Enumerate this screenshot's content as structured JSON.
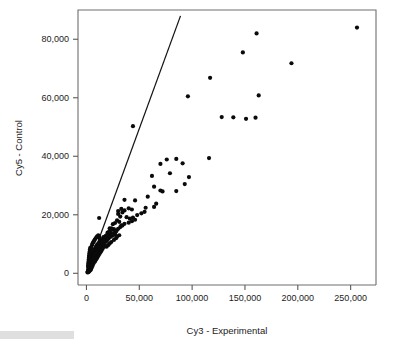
{
  "figure": {
    "background_color": "#ffffff",
    "point_color": "#0a0a0a",
    "line_color": "#141414",
    "frame_color": "#6e6e6e"
  },
  "chart_data": {
    "type": "scatter",
    "title": "",
    "xlabel": "Cy3 - Experimental",
    "ylabel": "Cy5 - Control",
    "xlim": [
      -8000,
      274000
    ],
    "ylim": [
      -4000,
      90000
    ],
    "xticks": [
      0,
      50000,
      100000,
      150000,
      200000,
      250000
    ],
    "xtick_labels": [
      "0",
      "50,000",
      "100,000",
      "150,000",
      "200,000",
      "250,000"
    ],
    "yticks": [
      0,
      20000,
      40000,
      60000,
      80000
    ],
    "ytick_labels": [
      "0",
      "20,000",
      "40,000",
      "60,000",
      "80,000"
    ],
    "grid": false,
    "legend": null,
    "annotations": [],
    "reference_line": {
      "name": "identity-trend-line",
      "x0": 0,
      "y0": 0,
      "x1": 89000,
      "y1": 88000,
      "slope": 0.9888,
      "intercept": 0
    },
    "series": [
      {
        "name": "spots",
        "marker": "filled-circle",
        "marker_size": 2.1,
        "points": [
          [
            256000,
            84000
          ],
          [
            161000,
            82000
          ],
          [
            148000,
            75500
          ],
          [
            194000,
            71800
          ],
          [
            117000,
            66800
          ],
          [
            96000,
            60500
          ],
          [
            163000,
            60800
          ],
          [
            128000,
            53400
          ],
          [
            139000,
            53300
          ],
          [
            151000,
            52800
          ],
          [
            160000,
            53200
          ],
          [
            44000,
            50300
          ],
          [
            116000,
            39400
          ],
          [
            85000,
            39100
          ],
          [
            76000,
            38900
          ],
          [
            70000,
            37400
          ],
          [
            91000,
            37600
          ],
          [
            79000,
            34200
          ],
          [
            62000,
            33300
          ],
          [
            97000,
            32900
          ],
          [
            93000,
            30500
          ],
          [
            64000,
            29600
          ],
          [
            70000,
            28300
          ],
          [
            72000,
            28000
          ],
          [
            85000,
            28100
          ],
          [
            58000,
            26200
          ],
          [
            36000,
            25100
          ],
          [
            46000,
            24900
          ],
          [
            66000,
            23800
          ],
          [
            64000,
            22700
          ],
          [
            56000,
            22400
          ],
          [
            40000,
            22200
          ],
          [
            43000,
            21800
          ],
          [
            36000,
            21500
          ],
          [
            33000,
            22000
          ],
          [
            34000,
            20800
          ],
          [
            30000,
            20300
          ],
          [
            30000,
            21300
          ],
          [
            32000,
            19400
          ],
          [
            38000,
            19200
          ],
          [
            41000,
            18700
          ],
          [
            44000,
            19000
          ],
          [
            48000,
            19900
          ],
          [
            52000,
            20500
          ],
          [
            55000,
            21000
          ],
          [
            12000,
            18900
          ],
          [
            29000,
            18100
          ],
          [
            27000,
            17200
          ],
          [
            25000,
            16800
          ],
          [
            31000,
            17600
          ],
          [
            33000,
            16400
          ],
          [
            36000,
            16900
          ],
          [
            40000,
            17300
          ],
          [
            43000,
            17800
          ],
          [
            46000,
            18300
          ],
          [
            22000,
            15400
          ],
          [
            24000,
            14800
          ],
          [
            26000,
            15100
          ],
          [
            28000,
            14300
          ],
          [
            20000,
            13900
          ],
          [
            21000,
            13100
          ],
          [
            23000,
            13600
          ],
          [
            25000,
            12900
          ],
          [
            27000,
            13400
          ],
          [
            29000,
            12600
          ],
          [
            31000,
            13000
          ],
          [
            18000,
            12700
          ],
          [
            19000,
            12100
          ],
          [
            17000,
            11800
          ],
          [
            16000,
            12400
          ],
          [
            15000,
            11500
          ],
          [
            14000,
            11100
          ],
          [
            13000,
            10800
          ],
          [
            12000,
            10400
          ],
          [
            11000,
            10100
          ],
          [
            10000,
            9700
          ],
          [
            9500,
            9300
          ],
          [
            9000,
            9000
          ],
          [
            8500,
            8600
          ],
          [
            8000,
            8300
          ],
          [
            7500,
            7900
          ],
          [
            7000,
            7600
          ],
          [
            6500,
            7200
          ],
          [
            6000,
            6900
          ],
          [
            5500,
            6500
          ],
          [
            5000,
            6200
          ],
          [
            4800,
            5800
          ],
          [
            4500,
            5500
          ],
          [
            4200,
            5100
          ],
          [
            4000,
            4800
          ],
          [
            3800,
            4400
          ],
          [
            3600,
            4100
          ],
          [
            3400,
            3800
          ],
          [
            3200,
            3400
          ],
          [
            3000,
            3100
          ],
          [
            2800,
            2800
          ],
          [
            2600,
            2400
          ],
          [
            2400,
            2100
          ],
          [
            2200,
            1800
          ],
          [
            2000,
            1500
          ],
          [
            1800,
            1200
          ],
          [
            1600,
            900
          ],
          [
            1400,
            700
          ],
          [
            1200,
            500
          ],
          [
            1000,
            300
          ],
          [
            5200,
            9600
          ],
          [
            5800,
            10200
          ],
          [
            6400,
            10600
          ],
          [
            7100,
            11000
          ],
          [
            7800,
            11400
          ],
          [
            8600,
            11900
          ],
          [
            9400,
            12300
          ],
          [
            10200,
            12600
          ],
          [
            11200,
            13000
          ],
          [
            12200,
            12200
          ],
          [
            13200,
            11600
          ],
          [
            14200,
            11000
          ],
          [
            15200,
            10400
          ],
          [
            16200,
            9900
          ],
          [
            17200,
            9400
          ],
          [
            4600,
            8800
          ],
          [
            4100,
            8100
          ],
          [
            3700,
            7400
          ],
          [
            3300,
            6700
          ],
          [
            3100,
            6000
          ],
          [
            2900,
            5400
          ],
          [
            2700,
            4700
          ],
          [
            2500,
            4000
          ],
          [
            2300,
            3300
          ],
          [
            2100,
            2700
          ],
          [
            1900,
            2000
          ],
          [
            5600,
            4500
          ],
          [
            6200,
            5000
          ],
          [
            6800,
            5600
          ],
          [
            7400,
            6100
          ],
          [
            8200,
            6700
          ],
          [
            9000,
            7200
          ],
          [
            9800,
            7800
          ],
          [
            10600,
            8300
          ],
          [
            11400,
            8900
          ],
          [
            12400,
            9400
          ],
          [
            13400,
            10000
          ],
          [
            14400,
            10500
          ],
          [
            15400,
            11100
          ],
          [
            16400,
            11600
          ],
          [
            17600,
            12100
          ],
          [
            18600,
            12700
          ],
          [
            19600,
            13200
          ],
          [
            20600,
            13800
          ],
          [
            21600,
            14300
          ],
          [
            22600,
            14900
          ],
          [
            23600,
            15400
          ],
          [
            2900,
            1700
          ],
          [
            3500,
            2200
          ],
          [
            4300,
            2900
          ],
          [
            5100,
            3500
          ],
          [
            6000,
            4200
          ],
          [
            6900,
            4900
          ],
          [
            7900,
            5500
          ],
          [
            8900,
            6200
          ],
          [
            9900,
            6800
          ],
          [
            10900,
            7500
          ],
          [
            11900,
            8100
          ],
          [
            13000,
            8800
          ],
          [
            14000,
            9400
          ],
          [
            15000,
            10100
          ],
          [
            16000,
            10700
          ],
          [
            1500,
            2500
          ],
          [
            1700,
            3200
          ],
          [
            1900,
            3900
          ],
          [
            2100,
            4600
          ],
          [
            2300,
            5300
          ],
          [
            2500,
            6000
          ],
          [
            2700,
            6700
          ],
          [
            3000,
            7400
          ],
          [
            3300,
            8100
          ],
          [
            3600,
            8700
          ],
          [
            18500,
            10800
          ],
          [
            19500,
            11300
          ],
          [
            21000,
            11900
          ],
          [
            22500,
            12400
          ],
          [
            24000,
            12900
          ],
          [
            25500,
            13500
          ],
          [
            27000,
            14100
          ],
          [
            28500,
            14600
          ],
          [
            30000,
            15200
          ],
          [
            32000,
            15800
          ],
          [
            34000,
            16300
          ],
          [
            8300,
            4200
          ],
          [
            9300,
            4800
          ],
          [
            10300,
            5400
          ],
          [
            11300,
            6000
          ],
          [
            12300,
            6600
          ],
          [
            13300,
            7200
          ],
          [
            14300,
            7800
          ],
          [
            15300,
            8400
          ],
          [
            16300,
            9000
          ],
          [
            17300,
            9600
          ],
          [
            19000,
            9100
          ],
          [
            20500,
            9600
          ],
          [
            22000,
            10200
          ],
          [
            23500,
            10700
          ],
          [
            26000,
            11400
          ],
          [
            28000,
            12000
          ],
          [
            5000,
            2000
          ],
          [
            5800,
            2600
          ],
          [
            6600,
            3300
          ],
          [
            7600,
            3900
          ],
          [
            4400,
            1500
          ],
          [
            3900,
            1100
          ],
          [
            3100,
            900
          ],
          [
            2400,
            600
          ],
          [
            1800,
            400
          ]
        ]
      }
    ]
  }
}
